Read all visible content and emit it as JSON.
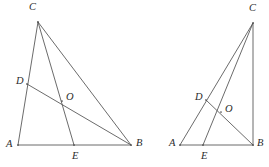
{
  "figure": {
    "type": "geometry-diagram",
    "background_color": "#ffffff",
    "line_color": "#5a5a5a",
    "label_color": "#2b2b2b",
    "line_width": 0.9,
    "width": 269,
    "height": 167
  },
  "figures": [
    {
      "id": "left-triangle",
      "name": "left-figure",
      "points": {
        "A": {
          "label": "A",
          "x": 18,
          "y": 145,
          "label_x": 6,
          "label_y": 139
        },
        "B": {
          "label": "B",
          "x": 131,
          "y": 145,
          "label_x": 136,
          "label_y": 138
        },
        "C": {
          "label": "C",
          "x": 38,
          "y": 22,
          "label_x": 29,
          "label_y": 2
        },
        "D": {
          "label": "D",
          "x": 27,
          "y": 84,
          "label_x": 16,
          "label_y": 76
        },
        "E": {
          "label": "E",
          "x": 74,
          "y": 145,
          "label_x": 72,
          "label_y": 151
        },
        "O": {
          "label": "O",
          "x": 62,
          "y": 101,
          "label_x": 66,
          "label_y": 92
        }
      },
      "segments": [
        {
          "name": "side-AB",
          "from": "A",
          "to": "B"
        },
        {
          "name": "side-AC",
          "from": "A",
          "to": "C"
        },
        {
          "name": "side-CB",
          "from": "C",
          "to": "B"
        },
        {
          "name": "cevian-CE",
          "from": "C",
          "to": "E"
        },
        {
          "name": "cevian-DB",
          "from": "D",
          "to": "B"
        }
      ]
    },
    {
      "id": "right-triangle",
      "name": "right-figure",
      "points": {
        "A": {
          "label": "A",
          "x": 180,
          "y": 145,
          "label_x": 169,
          "label_y": 138
        },
        "B": {
          "label": "B",
          "x": 253,
          "y": 145,
          "label_x": 257,
          "label_y": 138
        },
        "C": {
          "label": "C",
          "x": 253,
          "y": 23,
          "label_x": 249,
          "label_y": 3
        },
        "D": {
          "label": "D",
          "x": 206,
          "y": 100,
          "label_x": 195,
          "label_y": 92
        },
        "E": {
          "label": "E",
          "x": 203,
          "y": 145,
          "label_x": 201,
          "label_y": 151
        },
        "O": {
          "label": "O",
          "x": 221,
          "y": 112,
          "label_x": 225,
          "label_y": 104
        }
      },
      "segments": [
        {
          "name": "side-AB",
          "from": "A",
          "to": "B"
        },
        {
          "name": "side-AC",
          "from": "A",
          "to": "C"
        },
        {
          "name": "side-CB",
          "from": "C",
          "to": "B"
        },
        {
          "name": "cevian-CE",
          "from": "C",
          "to": "E"
        },
        {
          "name": "cevian-DB",
          "from": "D",
          "to": "B"
        }
      ]
    }
  ]
}
